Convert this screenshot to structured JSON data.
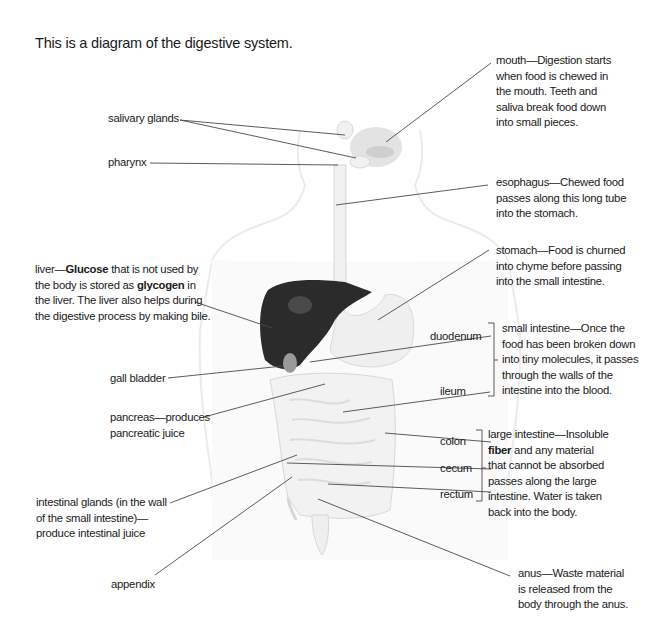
{
  "title": "This is a diagram of the digestive system.",
  "labels": {
    "salivary_glands": "salivary glands",
    "pharynx": "pharynx",
    "gall_bladder": "gall bladder",
    "appendix": "appendix",
    "duodenum": "duodenum",
    "ileum": "ileum",
    "colon": "colon",
    "cecum": "cecum",
    "rectum": "rectum"
  },
  "descriptions": {
    "mouth": [
      "mouth—Digestion starts",
      "when food is chewed in",
      "the mouth. Teeth and",
      "saliva break food down",
      "into small pieces."
    ],
    "esophagus": [
      "esophagus—Chewed food",
      "passes along this long tube",
      "into the stomach."
    ],
    "stomach": [
      "stomach—Food is churned",
      "into chyme before passing",
      "into the small intestine."
    ],
    "liver": {
      "line1_pre": "liver—",
      "line1_bold": "Glucose",
      "line1_post": " that is not used by",
      "line2_pre": "the body is stored as ",
      "line2_bold": "glycogen",
      "line2_post": " in",
      "line3": "the liver. The liver also helps during",
      "line4": "the digestive process by making bile."
    },
    "pancreas": [
      "pancreas—produces",
      "pancreatic juice"
    ],
    "small_intestine": [
      "small intestine—Once the",
      "food has been broken down",
      "into tiny molecules, it passes",
      "through the walls of the",
      "intestine into the blood."
    ],
    "large_intestine": {
      "line1": "large intestine—Insoluble",
      "line2_bold": "fiber",
      "line2_post": " and any material",
      "line3": "that cannot be absorbed",
      "line4": "passes along the large",
      "line5": "intestine. Water is taken",
      "line6": "back into the body."
    },
    "intestinal_glands": [
      "intestinal glands (in the wall",
      "of the small intestine)—",
      "produce intestinal juice"
    ],
    "anus": [
      "anus—Waste material",
      "is released from the",
      "body through the anus."
    ]
  },
  "colors": {
    "liver": "#2b2b2b",
    "organ_fill": "#eeeeee",
    "body_outline": "#e6e6e6",
    "leader_line": "#4a4a4a"
  }
}
